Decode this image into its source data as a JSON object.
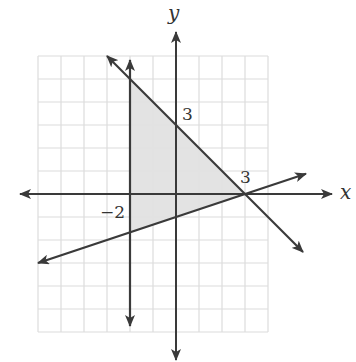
{
  "figure": {
    "type": "linear-inequality-system-graph",
    "axes": {
      "x_label": "x",
      "y_label": "y",
      "x_range": [
        -6,
        4
      ],
      "y_range": [
        -6,
        6
      ],
      "grid": true,
      "unit_px": 23,
      "origin_px": [
        176,
        194
      ]
    },
    "tick_labels": [
      {
        "text": "3",
        "at": "y=3"
      },
      {
        "text": "3",
        "at": "x=3"
      },
      {
        "text": "−2",
        "at": "x=-2"
      }
    ],
    "lines": [
      {
        "name": "vertical-boundary",
        "equation": "x = -2"
      },
      {
        "name": "descending-boundary",
        "equation": "x + y = 3"
      },
      {
        "name": "ascending-boundary",
        "equation": "x - 3y = 3"
      }
    ],
    "shaded_region": {
      "shape": "triangle",
      "vertices": [
        [
          -2,
          5
        ],
        [
          3,
          0
        ],
        [
          -2,
          -1.6667
        ]
      ]
    },
    "colors": {
      "grid": "#d9d9d9",
      "lines": "#3a3a3a",
      "shade": "#e3e3e3",
      "text": "#333333"
    }
  },
  "labels": {
    "x_axis": "x",
    "y_axis": "y",
    "y_tick_3": "3",
    "x_tick_3": "3",
    "x_tick_neg2": "−2"
  }
}
